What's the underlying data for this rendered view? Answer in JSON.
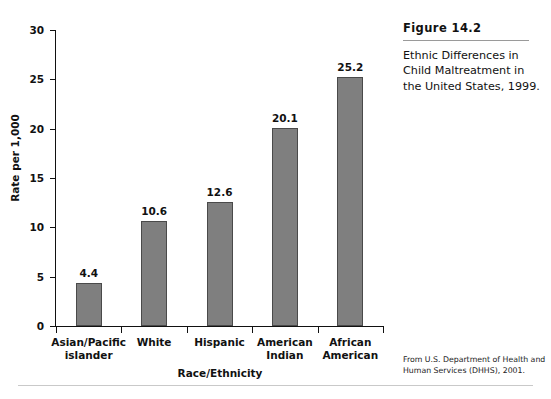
{
  "caption": {
    "figure_number": "Figure 14.2",
    "text": "Ethnic Differences in Child Maltreatment in the United States, 1999."
  },
  "source_note": "From U.S. Department of Health and Human Services (DHHS), 2001.",
  "colors": {
    "bar_fill": "#7f7f7f",
    "bar_border": "#4a4a4a",
    "axis": "#111111",
    "rule": "#9a9a9a",
    "page_rule": "#c9c9c9"
  },
  "chart_data": {
    "type": "bar",
    "title": "",
    "xlabel": "Race/Ethnicity",
    "ylabel": "Rate per 1,000",
    "categories": [
      "Asian/Pacific islander",
      "White",
      "Hispanic",
      "American Indian",
      "African American"
    ],
    "category_lines": [
      [
        "Asian/Pacific",
        "islander"
      ],
      [
        "White",
        ""
      ],
      [
        "Hispanic",
        ""
      ],
      [
        "American",
        "Indian"
      ],
      [
        "African",
        "American"
      ]
    ],
    "values": [
      4.4,
      10.6,
      12.6,
      20.1,
      25.2
    ],
    "value_labels": [
      "4.4",
      "10.6",
      "12.6",
      "20.1",
      "25.2"
    ],
    "ylim": [
      0,
      30
    ],
    "yticks": [
      0,
      5,
      10,
      15,
      20,
      25,
      30
    ],
    "ytick_labels": [
      "0",
      "5",
      "10",
      "15",
      "20",
      "25",
      "30"
    ],
    "grid": false,
    "legend": false
  }
}
